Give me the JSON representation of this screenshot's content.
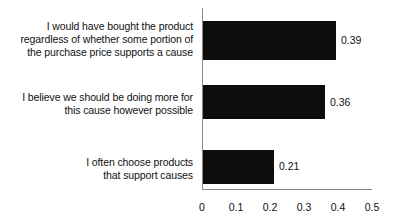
{
  "chart_data": {
    "type": "bar",
    "orientation": "horizontal",
    "title": "",
    "xlabel": "",
    "ylabel": "",
    "xlim": [
      0,
      0.5
    ],
    "xticks": [
      "0",
      "0.1",
      "0.2",
      "0.3",
      "0.4",
      "0.5"
    ],
    "xtick_values": [
      0,
      0.1,
      0.2,
      0.3,
      0.4,
      0.5
    ],
    "grid": false,
    "legend": false,
    "bar_color": "#0d0d0d",
    "axis_color": "#8a8a8a",
    "background": "#ffffff",
    "categories": [
      "I would have bought the product regardless of whether some portion of the purchase price supports a cause",
      "I believe we should be doing more for this cause however possible",
      "I often choose products that support causes"
    ],
    "values": [
      0.39,
      0.36,
      0.21
    ],
    "value_labels": [
      "0.39",
      "0.36",
      "0.21"
    ],
    "category_lines": [
      [
        "I would have bought the product",
        "regardless of whether some portion of",
        "the purchase price supports a cause"
      ],
      [
        "I believe we should be doing more for",
        "this cause however possible"
      ],
      [
        "I often choose products",
        "that support causes"
      ]
    ]
  }
}
